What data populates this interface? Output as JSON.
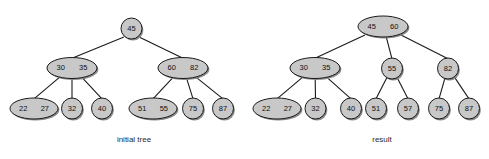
{
  "figure": {
    "width": 489,
    "height": 159,
    "background_color": "#ffffff",
    "node_fill_color": "#c8c8c8",
    "node_stroke_color": "#1a1a1a",
    "node_shadow_color": "#8a8a8a",
    "edge_color": "#1a1a1a",
    "text_color": "#101010",
    "caption_color": "#2b2b2b"
  },
  "diagrams": [
    {
      "id": "initial-tree",
      "caption": "initial tree",
      "caption_x": 134,
      "caption_y": 140,
      "nodes": [
        {
          "id": "i-root",
          "keys": [
            "45"
          ],
          "cx": 131.5,
          "cy": 28.5,
          "rx": 10.5,
          "ry": 10.5
        },
        {
          "id": "i-n1",
          "keys": [
            "30",
            "35"
          ],
          "cx": 72.0,
          "cy": 68.0,
          "rx": 25.0,
          "ry": 10.5
        },
        {
          "id": "i-n2",
          "keys": [
            "60",
            "82"
          ],
          "cx": 183.0,
          "cy": 68.0,
          "rx": 25.0,
          "ry": 10.5
        },
        {
          "id": "i-l1",
          "keys": [
            "22",
            "27"
          ],
          "cx": 34.0,
          "cy": 108.5,
          "rx": 24.0,
          "ry": 10.5
        },
        {
          "id": "i-l2",
          "keys": [
            "32"
          ],
          "cx": 72.0,
          "cy": 108.5,
          "rx": 10.5,
          "ry": 10.5
        },
        {
          "id": "i-l3",
          "keys": [
            "40"
          ],
          "cx": 102.0,
          "cy": 108.5,
          "rx": 10.5,
          "ry": 10.5
        },
        {
          "id": "i-l4",
          "keys": [
            "51",
            "55"
          ],
          "cx": 153.0,
          "cy": 108.5,
          "rx": 24.0,
          "ry": 10.5
        },
        {
          "id": "i-l5",
          "keys": [
            "75"
          ],
          "cx": 193.0,
          "cy": 108.5,
          "rx": 10.5,
          "ry": 10.5
        },
        {
          "id": "i-l6",
          "keys": [
            "87"
          ],
          "cx": 223.0,
          "cy": 108.5,
          "rx": 10.5,
          "ry": 10.5
        }
      ],
      "edges": [
        {
          "from": "i-root",
          "to": "i-n1"
        },
        {
          "from": "i-root",
          "to": "i-n2"
        },
        {
          "from": "i-n1",
          "to": "i-l1"
        },
        {
          "from": "i-n1",
          "to": "i-l2"
        },
        {
          "from": "i-n1",
          "to": "i-l3"
        },
        {
          "from": "i-n2",
          "to": "i-l4"
        },
        {
          "from": "i-n2",
          "to": "i-l5"
        },
        {
          "from": "i-n2",
          "to": "i-l6"
        }
      ]
    },
    {
      "id": "result-tree",
      "caption": "result",
      "caption_x": 382,
      "caption_y": 140,
      "nodes": [
        {
          "id": "r-root",
          "keys": [
            "45",
            "60"
          ],
          "cx": 383.0,
          "cy": 26.5,
          "rx": 25.0,
          "ry": 10.5
        },
        {
          "id": "r-n1",
          "keys": [
            "30",
            "35"
          ],
          "cx": 315.0,
          "cy": 68.0,
          "rx": 25.0,
          "ry": 10.5
        },
        {
          "id": "r-n2",
          "keys": [
            "55"
          ],
          "cx": 392.0,
          "cy": 68.5,
          "rx": 10.5,
          "ry": 10.5
        },
        {
          "id": "r-n3",
          "keys": [
            "82"
          ],
          "cx": 448.0,
          "cy": 68.5,
          "rx": 10.5,
          "ry": 10.5
        },
        {
          "id": "r-l1",
          "keys": [
            "22",
            "27"
          ],
          "cx": 277.0,
          "cy": 108.5,
          "rx": 24.0,
          "ry": 10.5
        },
        {
          "id": "r-l2",
          "keys": [
            "32"
          ],
          "cx": 315.5,
          "cy": 108.5,
          "rx": 10.5,
          "ry": 10.5
        },
        {
          "id": "r-l3",
          "keys": [
            "40"
          ],
          "cx": 351.0,
          "cy": 108.5,
          "rx": 10.5,
          "ry": 10.5
        },
        {
          "id": "r-l4",
          "keys": [
            "51"
          ],
          "cx": 376.0,
          "cy": 108.5,
          "rx": 10.5,
          "ry": 10.5
        },
        {
          "id": "r-l5",
          "keys": [
            "57"
          ],
          "cx": 408.0,
          "cy": 108.5,
          "rx": 10.5,
          "ry": 10.5
        },
        {
          "id": "r-l6",
          "keys": [
            "75"
          ],
          "cx": 439.0,
          "cy": 108.5,
          "rx": 10.5,
          "ry": 10.5
        },
        {
          "id": "r-l7",
          "keys": [
            "87"
          ],
          "cx": 469.0,
          "cy": 108.5,
          "rx": 10.5,
          "ry": 10.5
        }
      ],
      "edges": [
        {
          "from": "r-root",
          "to": "r-n1"
        },
        {
          "from": "r-root",
          "to": "r-n2"
        },
        {
          "from": "r-root",
          "to": "r-n3"
        },
        {
          "from": "r-n1",
          "to": "r-l1"
        },
        {
          "from": "r-n1",
          "to": "r-l2"
        },
        {
          "from": "r-n1",
          "to": "r-l3"
        },
        {
          "from": "r-n2",
          "to": "r-l4"
        },
        {
          "from": "r-n2",
          "to": "r-l5"
        },
        {
          "from": "r-n3",
          "to": "r-l6"
        },
        {
          "from": "r-n3",
          "to": "r-l7"
        }
      ]
    }
  ]
}
